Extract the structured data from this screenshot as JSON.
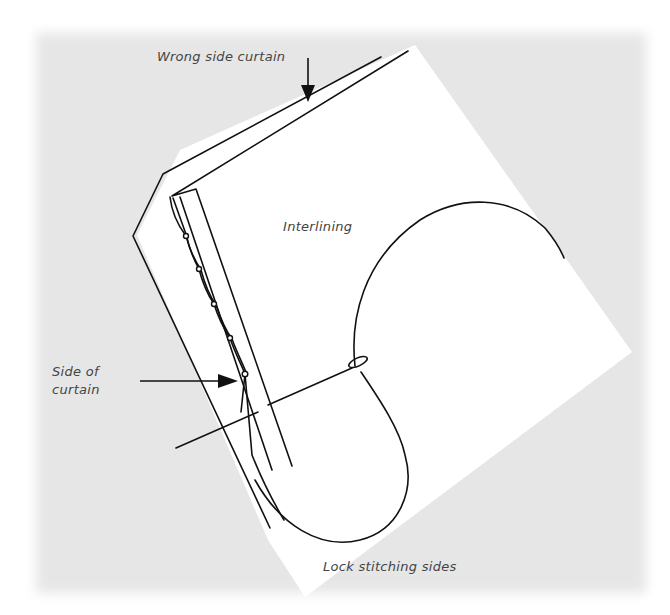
{
  "figure": {
    "labels": {
      "wrong_side_curtain": "Wrong side curtain",
      "interlining": "Interlining",
      "side_of": "Side of",
      "curtain": "curtain",
      "lock_stitching_sides": "Lock stitching sides"
    },
    "colors": {
      "background_texture": "#e9e9e9",
      "paper": "#ffffff",
      "ink": "#111111",
      "label_text": "#444444"
    },
    "stitch_knots": [
      {
        "x": 186,
        "y": 236
      },
      {
        "x": 199,
        "y": 269
      },
      {
        "x": 214,
        "y": 304
      },
      {
        "x": 230,
        "y": 338
      },
      {
        "x": 245,
        "y": 374
      }
    ]
  }
}
